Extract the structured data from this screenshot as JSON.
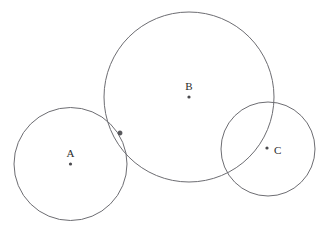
{
  "figure": {
    "background_color": "#ffffff",
    "stroke_color": "#6d6d72",
    "dot_color": "#4a4a4e",
    "label_color": "#2b2b2b",
    "width": 334,
    "height": 238
  },
  "circles": [
    {
      "id": "A",
      "label": "A",
      "center_x": 70.5,
      "center_y": 164,
      "radius": 56.5,
      "label_x": 70.5,
      "label_y": 157,
      "dot_x": 70.5,
      "dot_y": 164,
      "label_anchor": "middle"
    },
    {
      "id": "B",
      "label": "B",
      "center_x": 189,
      "center_y": 97,
      "radius": 85,
      "label_x": 189,
      "label_y": 90,
      "dot_x": 189,
      "dot_y": 97,
      "label_anchor": "middle"
    },
    {
      "id": "C",
      "label": "C",
      "center_x": 268,
      "center_y": 149,
      "radius": 47,
      "label_x": 274,
      "label_y": 154,
      "dot_x": 267,
      "dot_y": 148,
      "label_anchor": "start"
    }
  ],
  "marked_points": [
    {
      "id": "tangency-AB",
      "label": "",
      "x": 120,
      "y": 133,
      "radius": 2.2
    }
  ]
}
